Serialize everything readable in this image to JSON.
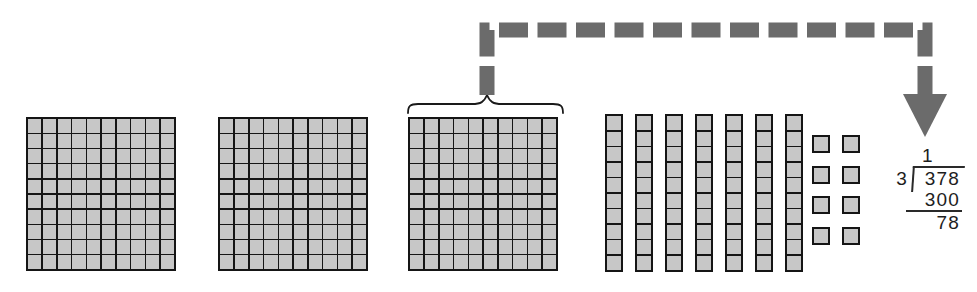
{
  "figure": {
    "blocks": {
      "hundreds_count": 3,
      "tens_count": 7,
      "ones_count": 8,
      "hundred_rows": 10,
      "hundred_cols": 10,
      "rod_cells": 10,
      "fill_color": "#c7c7c7",
      "line_color": "#151515"
    },
    "arrow": {
      "style": "dashed",
      "color": "#6b6b6b",
      "meaning": "points from the bracketed hundreds block to the quotient digit"
    },
    "brace": {
      "color": "#1a1a1a",
      "spans": "third hundreds block"
    },
    "division": {
      "quotient_digit": "1",
      "divisor": "3",
      "dividend": "378",
      "subtrahend": "300",
      "remainder": "78"
    }
  }
}
